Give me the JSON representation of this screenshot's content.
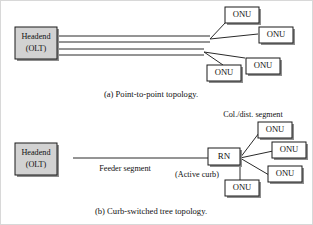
{
  "figure": {
    "background_color": "#ffffff",
    "line_color": "#2a2a2a",
    "node_fill_white": "#ffffff",
    "node_fill_gray": "#d2d2d2",
    "shadow_color": "#8e8e8e"
  },
  "panel_a": {
    "caption": "(a) Point-to-point topology.",
    "headend": {
      "line1": "Headend",
      "line2": "(OLT)"
    },
    "onus": [
      {
        "label": "ONU"
      },
      {
        "label": "ONU"
      },
      {
        "label": "ONU"
      },
      {
        "label": "ONU"
      }
    ]
  },
  "panel_b": {
    "caption": "(b) Curb-switched tree topology.",
    "headend": {
      "line1": "Headend",
      "line2": "(OLT)"
    },
    "rn": {
      "label": "RN",
      "sublabel": "(Active curb)"
    },
    "feeder_label": "Feeder segment",
    "distribution_label": "Col./dist. segment",
    "onus": [
      {
        "label": "ONU"
      },
      {
        "label": "ONU"
      },
      {
        "label": "ONU"
      },
      {
        "label": "ONU"
      }
    ]
  }
}
